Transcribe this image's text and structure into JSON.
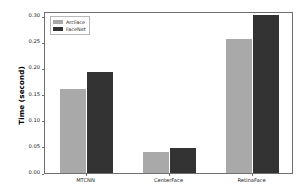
{
  "chart_data": {
    "type": "bar",
    "title": "",
    "xlabel": "",
    "ylabel": "Time (second)",
    "categories": [
      "MTCNN",
      "CenterFace",
      "RetinaFace"
    ],
    "series": [
      {
        "name": "ArcFace",
        "color": "#a9a9a9",
        "values": [
          0.161,
          0.04,
          0.256
        ]
      },
      {
        "name": "FaceNet",
        "color": "#333333",
        "values": [
          0.193,
          0.047,
          0.302
        ]
      }
    ],
    "ylim": [
      0.0,
      0.31
    ],
    "yticks": [
      0.0,
      0.05,
      0.1,
      0.15,
      0.2,
      0.25,
      0.3
    ],
    "ytick_labels": [
      "0.00",
      "0.05",
      "0.10",
      "0.15",
      "0.20",
      "0.25",
      "0.30"
    ],
    "grid": false,
    "legend_position": "upper-left"
  },
  "legend": {
    "entries": [
      {
        "label": "ArcFace"
      },
      {
        "label": "FaceNet"
      }
    ]
  },
  "axes": {
    "y_title": "Time (second)"
  }
}
